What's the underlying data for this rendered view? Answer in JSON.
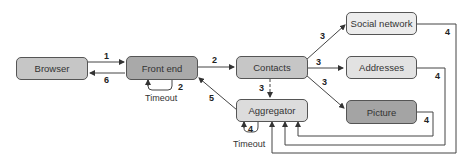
{
  "nodes": {
    "browser": {
      "label": "Browser",
      "color": "#c6c6c6"
    },
    "front_end": {
      "label": "Front end",
      "color": "#a9a9a9"
    },
    "contacts": {
      "label": "Contacts",
      "color": "#c6c6c6"
    },
    "aggregator": {
      "label": "Aggregator",
      "color": "#dcdcdc"
    },
    "social_network": {
      "label": "Social network",
      "color": "#ececec"
    },
    "addresses": {
      "label": "Addresses",
      "color": "#e2e2e2"
    },
    "picture": {
      "label": "Picture",
      "color": "#a4a4a4"
    }
  },
  "edges": {
    "browser_to_front": "1",
    "front_to_browser": "6",
    "front_timeout": "2",
    "front_to_contacts": "2",
    "contacts_to_social": "3",
    "contacts_to_addresses": "3",
    "contacts_to_picture": "3",
    "contacts_to_aggregator": "3",
    "aggregator_to_front": "5",
    "aggregator_timeout": "4",
    "social_to_aggregator": "4",
    "addresses_to_aggregator": "4",
    "picture_to_aggregator": "4"
  },
  "annotations": {
    "front_timeout_label": "Timeout",
    "aggregator_timeout_label": "Timeout"
  }
}
